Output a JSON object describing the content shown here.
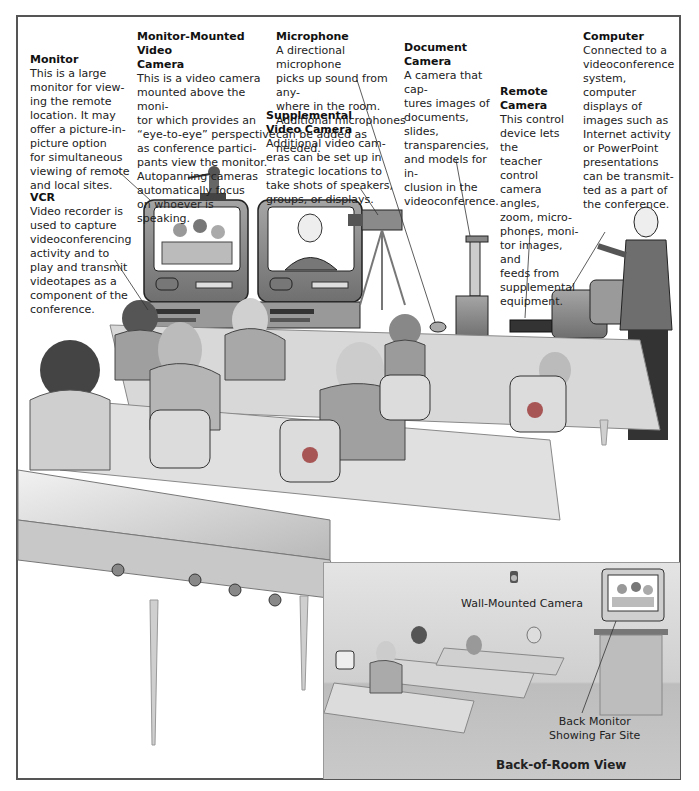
{
  "callouts": {
    "monitor": {
      "title": "Monitor",
      "body": "This is a large\nmonitor for view-\ning the remote\nlocation. It may\noffer a picture-in-\npicture option\nfor simultaneous\nviewing of remote\nand local sites."
    },
    "monitor_mounted_camera": {
      "title": "Monitor-Mounted Video\nCamera",
      "body": "This is a video camera\nmounted above the moni-\ntor which provides an\n“eye-to-eye” perspective\nas conference partici-\npants view the monitor.\nAutopanning cameras\nautomatically focus\non whoever is\nspeaking."
    },
    "vcr": {
      "title": "VCR",
      "body": "Video recorder is\nused to capture\nvideoconferencing\nactivity and to\nplay and transmit\nvideotapes as a\ncomponent of the\nconference."
    },
    "microphone": {
      "title": "Microphone",
      "body": "A directional microphone\npicks up sound from any-\nwhere in the room.\nAdditional microphones\ncan be added as needed."
    },
    "supplemental_camera": {
      "title": "Supplemental\nVideo Camera",
      "body": "Additional video cam-\neras can be set up in\nstrategic locations to\ntake shots of speakers,\ngroups, or displays."
    },
    "document_camera": {
      "title": "Document\nCamera",
      "body": "A camera that cap-\ntures images of\ndocuments, slides,\ntransparencies,\nand models for in-\nclusion in the\nvideoconference."
    },
    "remote_camera": {
      "title": "Remote\nCamera",
      "body": "This control\ndevice lets the\nteacher control\ncamera angles,\nzoom, micro-\nphones, moni-\ntor images, and\nfeeds from\nsupplemental\nequipment."
    },
    "computer": {
      "title": "Computer",
      "body": "Connected to a\nvideoconference\nsystem, computer\ndisplays of\nimages such as\nInternet activity\nor PowerPoint\npresentations\ncan be transmit-\nted as a part of\nthe conference."
    }
  },
  "inset": {
    "title": "Back-of-Room View",
    "wall_camera_label": "Wall-Mounted Camera",
    "back_monitor_label": "Back Monitor\nShowing Far Site"
  },
  "colors": {
    "frame": "#555555",
    "equipment": "#8a8a8a",
    "screen": "#ffffff",
    "table": "#d6d6d6",
    "accent": "#b06060"
  }
}
